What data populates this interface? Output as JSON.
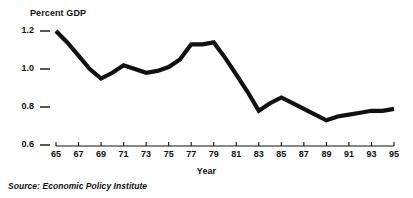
{
  "figure": {
    "background_color": "#ffffff",
    "line_color": "#111111",
    "text_color": "#111111"
  },
  "labels": {
    "y_axis_title": "Percent GDP",
    "x_axis_title": "Year",
    "source_note": "Source: Economic Policy Institute"
  },
  "chart_data": {
    "type": "line",
    "title": "",
    "subtitle": "",
    "xlabel": "Year",
    "ylabel": "Percent GDP",
    "annotations": [
      "Source: Economic Policy Institute"
    ],
    "legend": [],
    "legend_position": "none",
    "grid": false,
    "xlim": [
      65,
      95
    ],
    "ylim": [
      0.6,
      1.2
    ],
    "yticks": [
      0.6,
      0.8,
      1.0,
      1.2
    ],
    "ytick_labels": [
      "0.6",
      "0.8",
      "1.0",
      "1.2"
    ],
    "xticks": [
      65,
      67,
      69,
      71,
      73,
      75,
      77,
      79,
      81,
      83,
      85,
      87,
      89,
      91,
      93,
      95
    ],
    "xtick_labels": [
      "65",
      "67",
      "69",
      "71",
      "73",
      "75",
      "77",
      "79",
      "81",
      "83",
      "85",
      "87",
      "89",
      "91",
      "93",
      "95"
    ],
    "x": [
      65,
      66,
      67,
      68,
      69,
      70,
      71,
      72,
      73,
      74,
      75,
      76,
      77,
      78,
      79,
      80,
      81,
      82,
      83,
      84,
      85,
      86,
      87,
      88,
      89,
      90,
      91,
      92,
      93,
      94,
      95
    ],
    "values": [
      1.2,
      1.14,
      1.07,
      1.0,
      0.95,
      0.98,
      1.02,
      1.0,
      0.98,
      0.99,
      1.01,
      1.05,
      1.13,
      1.13,
      1.14,
      1.06,
      0.97,
      0.88,
      0.78,
      0.82,
      0.85,
      0.82,
      0.79,
      0.76,
      0.73,
      0.75,
      0.76,
      0.77,
      0.78,
      0.78,
      0.79
    ],
    "series": [
      {
        "name": "Percent GDP",
        "values": [
          1.2,
          1.14,
          1.07,
          1.0,
          0.95,
          0.98,
          1.02,
          1.0,
          0.98,
          0.99,
          1.01,
          1.05,
          1.13,
          1.13,
          1.14,
          1.06,
          0.97,
          0.88,
          0.78,
          0.82,
          0.85,
          0.82,
          0.79,
          0.76,
          0.73,
          0.75,
          0.76,
          0.77,
          0.78,
          0.78,
          0.79
        ]
      }
    ]
  }
}
